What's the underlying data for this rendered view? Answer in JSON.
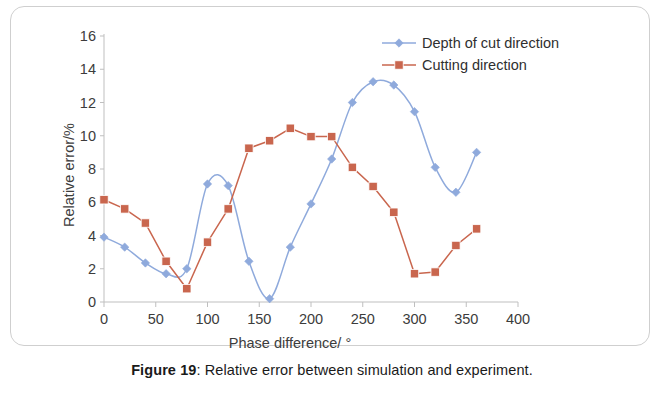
{
  "figure": {
    "caption_label": "Figure 19",
    "caption_separator": ": ",
    "caption_text": "Relative error between simulation and experiment."
  },
  "chart_data": {
    "type": "line",
    "title": "",
    "xlabel": "Phase difference/ °",
    "ylabel": "Relative error/%",
    "xlim": [
      0,
      400
    ],
    "ylim": [
      0,
      16
    ],
    "xticks": [
      0,
      50,
      100,
      150,
      200,
      250,
      300,
      350,
      400
    ],
    "yticks": [
      0,
      2,
      4,
      6,
      8,
      10,
      12,
      14,
      16
    ],
    "grid": false,
    "legend_position": "top-right",
    "x": [
      0,
      20,
      40,
      60,
      80,
      100,
      120,
      140,
      160,
      180,
      200,
      220,
      240,
      260,
      280,
      300,
      320,
      340,
      360
    ],
    "series": [
      {
        "name": "Depth of cut direction",
        "color": "#8FAADC",
        "marker": "diamond",
        "smooth": true,
        "values": [
          3.9,
          3.3,
          2.35,
          1.7,
          2.0,
          7.1,
          7.0,
          2.45,
          0.2,
          3.3,
          5.9,
          8.6,
          12.0,
          13.25,
          13.05,
          11.45,
          8.1,
          6.6,
          9.0
        ]
      },
      {
        "name": "Cutting direction",
        "color": "#C9664E",
        "marker": "square",
        "smooth": false,
        "values": [
          6.15,
          5.6,
          4.75,
          2.45,
          0.8,
          3.6,
          5.6,
          9.25,
          9.7,
          10.45,
          9.95,
          9.95,
          8.1,
          6.95,
          5.4,
          1.7,
          1.8,
          3.4,
          4.4
        ]
      }
    ],
    "axis_color": "#bfbfbf",
    "text_color": "#3c3c3c"
  }
}
